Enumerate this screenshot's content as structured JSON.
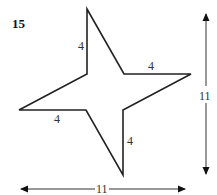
{
  "problem": {
    "number": "15",
    "shape": "four-pointed star",
    "side_labels": [
      "4",
      "4",
      "4",
      "4"
    ],
    "dimensions": {
      "height": "11",
      "width": "11"
    }
  },
  "colors": {
    "stroke": "#222222",
    "text": "#333333"
  }
}
